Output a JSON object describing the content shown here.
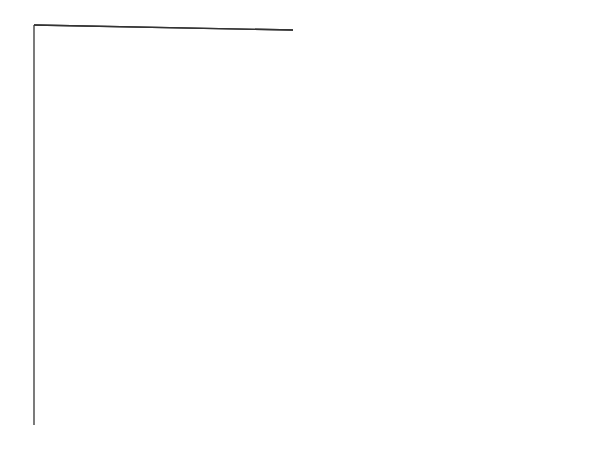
{
  "diagram": {
    "labels_left": {
      "ulna": "Ulna",
      "lunate": "Lunate",
      "lunate_alt": "(semilunar)",
      "triangular": "Triangular",
      "triangular_alt": "(triquestrum)",
      "pisiform": "Pisiform",
      "hamate": "Hamate",
      "hamate_alt": "(unciform)",
      "carpals": "Carpals",
      "metacarpals": "Metacarpals",
      "phalanges": "Phalanges"
    },
    "labels_right": {
      "radius": "Radius",
      "scaphoid": "Scaphoid",
      "scaphoid_alt": "(navicular)",
      "capitate": "Capitate",
      "trapezoid": "Trapezoid",
      "trapezoid_alt": "(lesser multangular)",
      "trapezium": "Trapezium",
      "trapezium_alt": "(greater multangular)",
      "carpals": "Carpals",
      "proximal_phalanx": "Proximal phalanx",
      "middle_phalanx": "Middle phalanx",
      "distal_phalanx": "Distal phalanx"
    },
    "digit_numbers": [
      "1",
      "2",
      "3",
      "4",
      "5"
    ],
    "copyright": "©AHIMA 2017"
  }
}
